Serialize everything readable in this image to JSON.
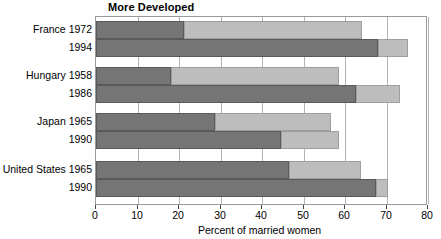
{
  "chart_data": {
    "type": "bar",
    "orientation": "horizontal",
    "stacked": true,
    "title": "More Developed",
    "xlabel": "Percent of married women",
    "ylabel": "",
    "xlim": [
      0,
      80
    ],
    "xticks": [
      0,
      10,
      20,
      30,
      40,
      50,
      60,
      70,
      80
    ],
    "xtick_labels": [
      "0",
      "10",
      "20",
      "30",
      "40",
      "50",
      "60",
      "70",
      "80"
    ],
    "grid": "vertical",
    "legend": "none",
    "categories": [
      "France 1972",
      "France 1994",
      "Hungary 1958",
      "Hungary 1986",
      "Japan 1965",
      "Japan 1990",
      "United States 1965",
      "United States 1990"
    ],
    "series": [
      {
        "name": "modern",
        "color": "#757575",
        "values": [
          21.3,
          68.0,
          18.0,
          62.7,
          28.6,
          44.6,
          46.5,
          67.5
        ]
      },
      {
        "name": "traditional",
        "color": "#bdbdbd",
        "values": [
          42.8,
          7.2,
          40.6,
          10.6,
          28.0,
          14.0,
          17.4,
          2.9
        ]
      }
    ],
    "totals": [
      64.1,
      75.2,
      58.6,
      73.3,
      56.6,
      58.6,
      63.9,
      70.4
    ],
    "groups": [
      {
        "label": "France",
        "rows": [
          0,
          1
        ]
      },
      {
        "label": "Hungary",
        "rows": [
          2,
          3
        ]
      },
      {
        "label": "Japan",
        "rows": [
          4,
          5
        ]
      },
      {
        "label": "United States",
        "rows": [
          6,
          7
        ]
      }
    ]
  },
  "axis": {
    "tick_0": "0",
    "tick_1": "10",
    "tick_2": "20",
    "tick_3": "30",
    "tick_4": "40",
    "tick_5": "50",
    "tick_6": "60",
    "tick_7": "70",
    "tick_8": "80"
  },
  "labels": {
    "row0": "France 1972",
    "row1": "1994",
    "row2": "Hungary 1958",
    "row3": "1986",
    "row4": "Japan 1965",
    "row5": "1990",
    "row6": "United States 1965",
    "row7": "1990"
  },
  "colors": {
    "modern": "#757575",
    "traditional": "#bdbdbd",
    "frame": "#9a9a9a",
    "grid": "#b3b3b3",
    "text": "#000000",
    "background": "#ffffff"
  }
}
